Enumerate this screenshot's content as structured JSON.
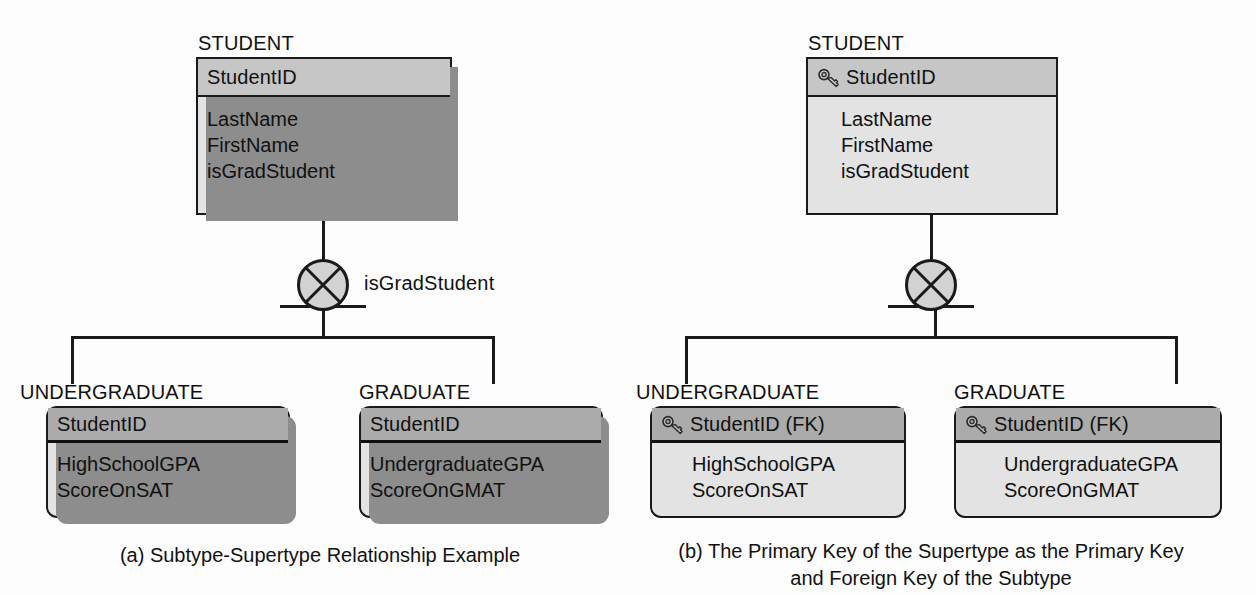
{
  "figure": {
    "type": "er-diagram"
  },
  "colors": {
    "page_background": "#fdfdfd",
    "line": "#1a1a1a",
    "supertype_header_fill": "#c6c6c6",
    "supertype_body_fill": "#e3e3e3",
    "subtype_header_fill": "#ababab",
    "subtype_body_fill": "#e3e3e3",
    "shadow": "#8d8d8d",
    "text": "#111111"
  },
  "panels": [
    {
      "id": "panel-a",
      "caption": "(a) Subtype-Supertype Relationship Example",
      "supertype": {
        "title": "STUDENT",
        "key_attribute": {
          "label": "StudentID",
          "has_key_icon": false
        },
        "attributes": [
          "LastName",
          "FirstName",
          "isGradStudent"
        ]
      },
      "discriminator": {
        "symbol": "exclusive-x-circle",
        "label": "isGradStudent",
        "completeness": "total-double-line"
      },
      "subtypes": [
        {
          "title": "UNDERGRADUATE",
          "key_attribute": {
            "label": "StudentID",
            "has_key_icon": false
          },
          "attributes": [
            "HighSchoolGPA",
            "ScoreOnSAT"
          ]
        },
        {
          "title": "GRADUATE",
          "key_attribute": {
            "label": "StudentID",
            "has_key_icon": false
          },
          "attributes": [
            "UndergraduateGPA",
            "ScoreOnGMAT"
          ]
        }
      ]
    },
    {
      "id": "panel-b",
      "caption": "(b) The Primary Key of the Supertype as the Primary Key\nand Foreign Key of the Subtype",
      "supertype": {
        "title": "STUDENT",
        "key_attribute": {
          "label": "StudentID",
          "has_key_icon": true
        },
        "attributes": [
          "LastName",
          "FirstName",
          "isGradStudent"
        ]
      },
      "discriminator": {
        "symbol": "exclusive-x-circle",
        "label": "",
        "completeness": "total-double-line"
      },
      "subtypes": [
        {
          "title": "UNDERGRADUATE",
          "key_attribute": {
            "label": "StudentID (FK)",
            "has_key_icon": true
          },
          "attributes": [
            "HighSchoolGPA",
            "ScoreOnSAT"
          ]
        },
        {
          "title": "GRADUATE",
          "key_attribute": {
            "label": "StudentID (FK)",
            "has_key_icon": true
          },
          "attributes": [
            "UndergraduateGPA",
            "ScoreOnGMAT"
          ]
        }
      ]
    }
  ],
  "icons": {
    "key": "key-icon",
    "exclusive_circle": "exclusive-x-circle-icon"
  }
}
